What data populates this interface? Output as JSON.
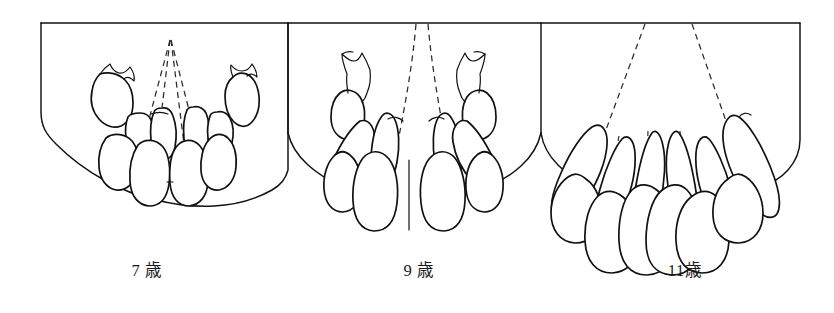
{
  "figure": {
    "type": "line-art-illustration",
    "background_color": "#ffffff",
    "ink_color": "#111111",
    "dash_color": "#2b2b2b"
  },
  "panels": [
    {
      "id": "panel-7",
      "caption": "7 歳",
      "age_years": 7,
      "dentition_stage": "mixed",
      "erupted_teeth_count": 6,
      "unerupted_crowns_count": 2,
      "axis_lines": 4,
      "axis_convergence": "single apex above arch"
    },
    {
      "id": "panel-9",
      "caption": "9 歳",
      "age_years": 9,
      "dentition_stage": "mixed",
      "erupted_teeth_count": 8,
      "unerupted_crowns_count": 2,
      "axis_lines": 6,
      "axis_convergence": "two lines reaching upper border"
    },
    {
      "id": "panel-11",
      "caption": "11歳",
      "age_years": 11,
      "dentition_stage": "permanent",
      "erupted_teeth_count": 8,
      "unerupted_crowns_count": 0,
      "axis_lines": 8,
      "axis_convergence": "two diverging lines to upper border"
    }
  ]
}
